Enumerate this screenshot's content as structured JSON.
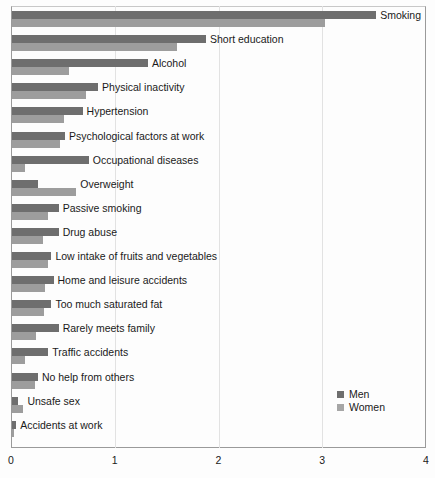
{
  "chart_data": {
    "type": "bar",
    "orientation": "horizontal",
    "title": "",
    "subtitle": "",
    "xlabel": "",
    "ylabel": "",
    "xlim": [
      0,
      4
    ],
    "xticks": [
      0,
      1,
      2,
      3,
      4
    ],
    "xtick_labels": [
      "0",
      "1",
      "2",
      "3",
      "4"
    ],
    "grid": true,
    "grid_axis": "x",
    "legend": {
      "position": "inside-bottom-right",
      "entries": [
        {
          "name": "Men",
          "color": "#6e6e6e"
        },
        {
          "name": "Women",
          "color": "#a6a6a6"
        }
      ]
    },
    "categories": [
      "Smoking",
      "Short education",
      "Alcohol",
      "Physical inactivity",
      "Hypertension",
      "Psychological factors at work",
      "Occupational diseases",
      "Overweight",
      "Passive smoking",
      "Drug abuse",
      "Low intake of fruits and vegetables",
      "Home and leisure accidents",
      "Too much saturated fat",
      "Rarely meets family",
      "Traffic accidents",
      "No help from others",
      "Unsafe sex",
      "Accidents at work"
    ],
    "series": [
      {
        "name": "Men",
        "color": "#6e6e6e",
        "values": [
          3.51,
          1.87,
          1.31,
          0.83,
          0.68,
          0.51,
          0.74,
          0.25,
          0.45,
          0.45,
          0.38,
          0.4,
          0.38,
          0.45,
          0.35,
          0.25,
          0.06,
          0.04
        ]
      },
      {
        "name": "Women",
        "color": "#9d9d9d",
        "values": [
          3.02,
          1.59,
          0.55,
          0.71,
          0.5,
          0.46,
          0.13,
          0.62,
          0.35,
          0.3,
          0.35,
          0.32,
          0.31,
          0.23,
          0.13,
          0.22,
          0.11,
          0.01
        ]
      }
    ]
  }
}
